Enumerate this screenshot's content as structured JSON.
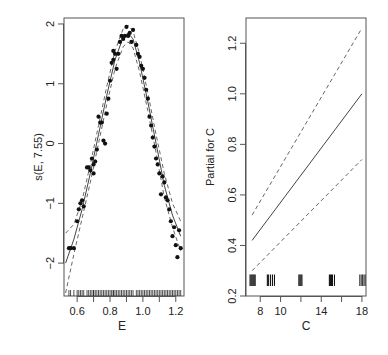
{
  "chart_data": [
    {
      "type": "scatter",
      "title": "",
      "xlabel": "E",
      "ylabel": "s(E, 7.55)",
      "xlim": [
        0.52,
        1.25
      ],
      "ylim": [
        -2.55,
        2.1
      ],
      "xticks": [
        "0.6",
        "0.8",
        "1.0",
        "1.2"
      ],
      "yticks": [
        "-2",
        "-1",
        "0",
        "1",
        "2"
      ],
      "grid": false,
      "legend": null,
      "series": [
        {
          "name": "smooth fit",
          "style": "solid",
          "x": [
            0.53,
            0.58,
            0.63,
            0.68,
            0.73,
            0.78,
            0.83,
            0.88,
            0.91,
            0.94,
            0.98,
            1.03,
            1.08,
            1.13,
            1.18,
            1.23
          ],
          "y": [
            -2.0,
            -1.6,
            -1.1,
            -0.5,
            0.15,
            0.8,
            1.4,
            1.78,
            1.85,
            1.75,
            1.35,
            0.7,
            0.0,
            -0.7,
            -1.2,
            -1.55
          ]
        },
        {
          "name": "upper band",
          "style": "dashed",
          "x": [
            0.53,
            0.58,
            0.63,
            0.68,
            0.73,
            0.78,
            0.83,
            0.88,
            0.91,
            0.94,
            0.98,
            1.03,
            1.08,
            1.13,
            1.18,
            1.23
          ],
          "y": [
            -1.5,
            -1.35,
            -0.95,
            -0.35,
            0.3,
            0.95,
            1.55,
            1.92,
            1.98,
            1.88,
            1.5,
            0.85,
            0.15,
            -0.5,
            -1.0,
            -1.3
          ]
        },
        {
          "name": "lower band",
          "style": "dashed",
          "x": [
            0.53,
            0.58,
            0.63,
            0.68,
            0.73,
            0.78,
            0.83,
            0.88,
            0.91,
            0.94,
            0.98,
            1.03,
            1.08,
            1.13,
            1.18,
            1.23
          ],
          "y": [
            -2.5,
            -1.85,
            -1.25,
            -0.65,
            0.0,
            0.65,
            1.25,
            1.62,
            1.7,
            1.6,
            1.2,
            0.55,
            -0.15,
            -0.9,
            -1.4,
            -1.8
          ]
        },
        {
          "name": "partial residuals",
          "style": "points",
          "x": [
            0.55,
            0.56,
            0.58,
            0.6,
            0.61,
            0.62,
            0.63,
            0.64,
            0.66,
            0.67,
            0.68,
            0.69,
            0.7,
            0.7,
            0.71,
            0.72,
            0.73,
            0.74,
            0.75,
            0.76,
            0.77,
            0.78,
            0.79,
            0.8,
            0.81,
            0.82,
            0.82,
            0.83,
            0.84,
            0.85,
            0.86,
            0.87,
            0.88,
            0.89,
            0.9,
            0.91,
            0.92,
            0.93,
            0.94,
            0.96,
            0.97,
            0.98,
            0.99,
            1.0,
            1.01,
            1.02,
            1.03,
            1.04,
            1.05,
            1.06,
            1.07,
            1.08,
            1.09,
            1.1,
            1.11,
            1.12,
            1.13,
            1.14,
            1.15,
            1.16,
            1.17,
            1.18,
            1.19,
            1.2,
            1.21,
            1.22,
            1.23
          ],
          "y": [
            -1.75,
            -1.75,
            -1.75,
            -1.3,
            -1.1,
            -1.0,
            -0.95,
            -1.05,
            -0.4,
            -0.4,
            -0.45,
            -0.25,
            -0.35,
            -0.5,
            -0.3,
            -0.1,
            0.45,
            0.35,
            0.35,
            0.05,
            0.0,
            0.5,
            0.75,
            1.05,
            1.35,
            1.4,
            1.55,
            1.5,
            1.25,
            1.5,
            1.7,
            1.8,
            1.75,
            1.8,
            1.95,
            1.8,
            1.85,
            1.7,
            1.9,
            1.65,
            1.5,
            1.45,
            1.3,
            1.25,
            1.1,
            0.9,
            0.75,
            0.45,
            0.3,
            0.1,
            -0.05,
            -0.25,
            -0.35,
            -0.5,
            -0.85,
            -0.55,
            -0.65,
            -0.9,
            -0.95,
            -1.1,
            -1.3,
            -1.55,
            -1.4,
            -1.7,
            -1.9,
            -1.45,
            -1.75
          ]
        }
      ]
    },
    {
      "type": "line",
      "title": "",
      "xlabel": "C",
      "ylabel": "Partial for C",
      "xlim": [
        6.6,
        18.4
      ],
      "ylim": [
        0.2,
        1.3
      ],
      "xticks": [
        "8",
        "10",
        "14",
        "18"
      ],
      "yticks": [
        "0.2",
        "0.4",
        "0.6",
        "0.8",
        "1.0",
        "1.2"
      ],
      "grid": false,
      "legend": null,
      "series": [
        {
          "name": "fit",
          "style": "solid",
          "x": [
            7.2,
            18.0
          ],
          "y": [
            0.42,
            1.0
          ]
        },
        {
          "name": "upper band",
          "style": "dashed",
          "x": [
            7.2,
            18.0
          ],
          "y": [
            0.52,
            1.26
          ]
        },
        {
          "name": "lower band",
          "style": "dashed",
          "x": [
            7.2,
            18.0
          ],
          "y": [
            0.3,
            0.74
          ]
        }
      ],
      "rug_x": [
        7.0,
        7.1,
        7.2,
        7.3,
        7.4,
        7.5,
        8.7,
        8.8,
        9.0,
        9.2,
        9.4,
        11.8,
        11.9,
        12.0,
        12.1,
        14.8,
        14.9,
        15.0,
        15.1,
        15.3,
        17.8,
        18.0,
        18.1,
        18.3
      ]
    }
  ]
}
